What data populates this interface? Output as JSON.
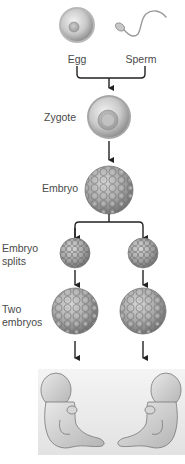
{
  "labels": {
    "egg": "Egg",
    "sperm": "Sperm",
    "zygote": "Zygote",
    "embryo": "Embryo",
    "embryo_splits_line1": "Embryo",
    "embryo_splits_line2": "splits",
    "two_embryos_line1": "Two",
    "two_embryos_line2": "embryos"
  },
  "stages": [
    {
      "name": "fertilization",
      "items": [
        "Egg",
        "Sperm"
      ]
    },
    {
      "name": "zygote",
      "items": [
        "Zygote"
      ]
    },
    {
      "name": "embryo",
      "items": [
        "Embryo"
      ]
    },
    {
      "name": "embryo-splits",
      "items": [
        "Embryo splits"
      ]
    },
    {
      "name": "two-embryos",
      "items": [
        "Two embryos"
      ]
    },
    {
      "name": "twin-fetuses",
      "items": [
        "fetus",
        "fetus"
      ]
    }
  ],
  "colors": {
    "background": "#ffffff",
    "arrow": "#222222",
    "cell_light": "#e4e4e4",
    "cell_dark": "#8a8a8a",
    "rim": "#9c9c9c",
    "panel": "#ececec",
    "text": "#4a4a4a"
  }
}
